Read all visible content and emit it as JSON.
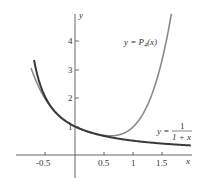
{
  "chart_data": {
    "type": "line",
    "title": "",
    "xlabel": "x",
    "ylabel": "y",
    "xlim": [
      -0.8,
      1.8
    ],
    "ylim": [
      -0.6,
      5.2
    ],
    "grid": false,
    "x_ticks": [
      "-0.5",
      "0.5",
      "1",
      "1.5"
    ],
    "y_ticks": [
      "1",
      "2",
      "3",
      "4"
    ],
    "series": [
      {
        "name": "y = P4(x)",
        "formula": "1 - x + x^2 - x^3 + x^4",
        "x": [
          -0.6,
          -0.5,
          -0.25,
          0,
          0.25,
          0.5,
          0.75,
          1,
          1.25,
          1.5,
          1.65
        ],
        "values": [
          2.18,
          1.94,
          1.33,
          1.0,
          0.8,
          0.69,
          0.74,
          1.0,
          1.61,
          2.84,
          4.0
        ]
      },
      {
        "name": "y = 1/(1+x)",
        "formula": "1/(1+x)",
        "x": [
          -0.65,
          -0.5,
          -0.25,
          0,
          0.25,
          0.5,
          0.75,
          1,
          1.25,
          1.5,
          1.8
        ],
        "values": [
          2.86,
          2.0,
          1.33,
          1.0,
          0.8,
          0.67,
          0.57,
          0.5,
          0.44,
          0.4,
          0.36
        ]
      }
    ],
    "annotations": [
      {
        "text": "y = P4(x)",
        "near": "upper right of polynomial curve"
      },
      {
        "text": "y = 1/(1+x)",
        "near": "right end of rational curve"
      }
    ]
  },
  "labels": {
    "x_axis": "x",
    "y_axis": "y",
    "p4_prefix": "y = P",
    "p4_sub": "4",
    "p4_suffix": "(x)",
    "rational_prefix": "y =",
    "rational_num": "1",
    "rational_den": "1 + x"
  }
}
